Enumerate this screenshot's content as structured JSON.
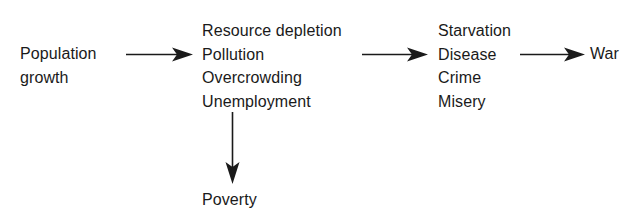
{
  "diagram": {
    "type": "flowchart",
    "nodes": {
      "population": {
        "lines": [
          "Population",
          "growth"
        ]
      },
      "effects": {
        "lines": [
          "Resource depletion",
          "Pollution",
          "Overcrowding",
          "Unemployment"
        ]
      },
      "consequences": {
        "lines": [
          "Starvation",
          "Disease",
          "Crime",
          "Misery"
        ]
      },
      "war": {
        "lines": [
          "War"
        ]
      },
      "poverty": {
        "lines": [
          "Poverty"
        ]
      }
    },
    "edges": [
      {
        "from": "population",
        "to": "effects",
        "direction": "right"
      },
      {
        "from": "effects",
        "to": "consequences",
        "direction": "right"
      },
      {
        "from": "consequences",
        "to": "war",
        "direction": "right"
      },
      {
        "from": "effects",
        "to": "poverty",
        "direction": "down"
      }
    ],
    "colors": {
      "ink": "#1a1a1a",
      "background": "#ffffff"
    }
  }
}
